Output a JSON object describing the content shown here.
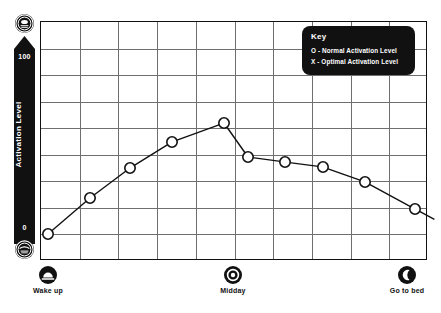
{
  "chart_data": {
    "type": "line",
    "title": "",
    "xlabel": "",
    "ylabel": "Activation Level",
    "ylim": [
      0,
      100
    ],
    "grid": true,
    "x_tick_labels": [
      "Wake up",
      "Midday",
      "Go to bed"
    ],
    "x_tick_icons": [
      "sunrise-icon",
      "sun-icon",
      "moon-icon"
    ],
    "y_tick_labels": [
      "100",
      "0"
    ],
    "legend_position": "top-right",
    "series": [
      {
        "name": "Normal Activation Level",
        "marker": "O",
        "x": [
          "Wake up",
          "",
          "",
          "",
          "Midday",
          "",
          "",
          "",
          "",
          "Go to bed"
        ],
        "values": [
          8,
          42,
          67,
          88,
          112,
          80,
          76,
          72,
          60,
          40
        ]
      }
    ],
    "points": [
      {
        "index": 1,
        "x_px": 48,
        "y_px": 234,
        "value": 8
      },
      {
        "index": 2,
        "x_px": 90,
        "y_px": 198,
        "value": 42
      },
      {
        "index": 3,
        "x_px": 130,
        "y_px": 168,
        "value": 67
      },
      {
        "index": 4,
        "x_px": 172,
        "y_px": 142,
        "value": 88
      },
      {
        "index": 5,
        "x_px": 224,
        "y_px": 123,
        "value": 112
      },
      {
        "index": 6,
        "x_px": 248,
        "y_px": 157,
        "value": 80
      },
      {
        "index": 7,
        "x_px": 285,
        "y_px": 162,
        "value": 76
      },
      {
        "index": 8,
        "x_px": 323,
        "y_px": 167,
        "value": 72
      },
      {
        "index": 9,
        "x_px": 365,
        "y_px": 182,
        "value": 60
      },
      {
        "index": 10,
        "x_px": 415,
        "y_px": 209,
        "value": 40
      }
    ]
  },
  "y_axis": {
    "title": "Activation Level",
    "max_label": "100",
    "min_label": "0",
    "high_icon": "alert-face-icon",
    "low_icon": "sleepy-face-icon"
  },
  "key": {
    "title": "Key",
    "entries": [
      "O - Normal Activation Level",
      "X - Optimal Activation Level"
    ]
  },
  "x_axis": {
    "markers": [
      {
        "label": "Wake up",
        "icon": "sunrise-icon"
      },
      {
        "label": "Midday",
        "icon": "sun-icon"
      },
      {
        "label": "Go to bed",
        "icon": "moon-icon"
      }
    ]
  },
  "colors": {
    "ink": "#111111",
    "grid": "#6f6f6f",
    "background": "#ffffff",
    "key_text": "#ffffff"
  }
}
